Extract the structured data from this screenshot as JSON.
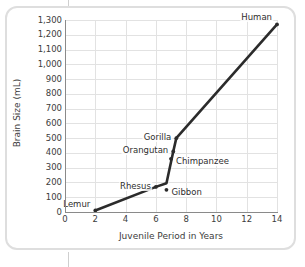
{
  "figure": {
    "frame_style": "rounded-rectangle-border",
    "border_color": "#dedede",
    "background": "#ffffff"
  },
  "chart_data": {
    "type": "line",
    "title": "",
    "xlabel": "Juvenile Period in Years",
    "ylabel": "Brain Size (mL)",
    "xlim": [
      0,
      14
    ],
    "ylim": [
      0,
      1300
    ],
    "xticks": [
      0,
      2,
      4,
      6,
      8,
      10,
      12,
      14
    ],
    "xtick_labels": [
      "0",
      "2",
      "4",
      "6",
      "8",
      "10",
      "12",
      "14"
    ],
    "yticks": [
      0,
      100,
      200,
      300,
      400,
      500,
      600,
      700,
      800,
      900,
      1000,
      1100,
      1200,
      1300
    ],
    "ytick_labels": [
      "0",
      "100",
      "200",
      "300",
      "400",
      "500",
      "600",
      "700",
      "800",
      "900",
      "1,000",
      "1,100",
      "1,200",
      "1,300"
    ],
    "grid": "both",
    "grid_color": "#e2e2e2",
    "legend": "none",
    "line_color": "#2b2b2b",
    "marker_color": "#2b2b2b",
    "series": [
      {
        "name": "Primate brain size vs juvenile period",
        "points": [
          {
            "label": "Lemur",
            "x": 2.0,
            "y": 10,
            "label_pos": "left-above"
          },
          {
            "label": "Rhesus",
            "x": 6.0,
            "y": 170,
            "label_pos": "left"
          },
          {
            "label": "Gibbon",
            "x": 6.7,
            "y": 150,
            "label_pos": "right"
          },
          {
            "label": "Chimpanzee",
            "x": 7.0,
            "y": 360,
            "label_pos": "right"
          },
          {
            "label": "Orangutan",
            "x": 7.15,
            "y": 410,
            "label_pos": "left"
          },
          {
            "label": "Gorilla",
            "x": 7.35,
            "y": 500,
            "label_pos": "left"
          },
          {
            "label": "Human",
            "x": 14.0,
            "y": 1270,
            "label_pos": "left-above"
          }
        ]
      }
    ],
    "connected_path": [
      {
        "x": 2.0,
        "y": 10
      },
      {
        "x": 6.0,
        "y": 170
      },
      {
        "x": 6.7,
        "y": 195
      },
      {
        "x": 7.15,
        "y": 410
      },
      {
        "x": 7.35,
        "y": 500
      },
      {
        "x": 14.0,
        "y": 1270
      }
    ],
    "annotations": [
      "Gibbon is an off-path marker below the main trend line",
      "Chimpanzee marker sits on the steep rising segment"
    ]
  }
}
